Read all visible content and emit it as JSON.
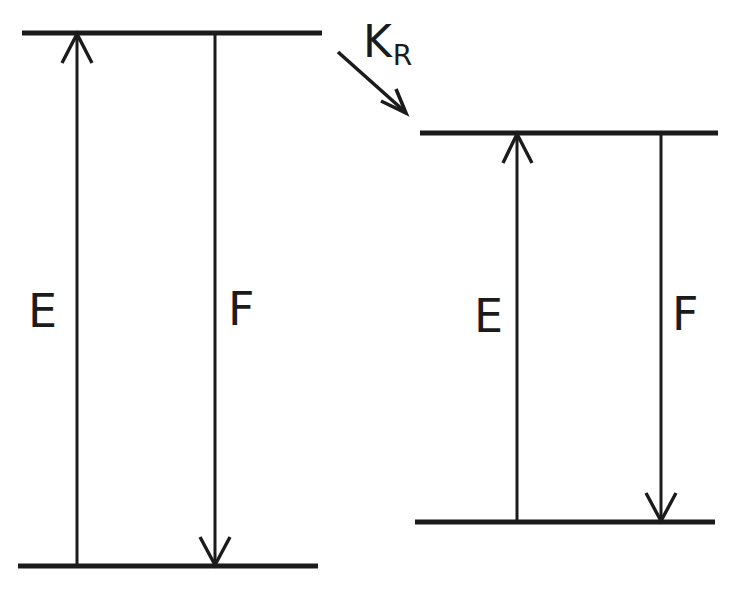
{
  "figure": {
    "kind": "energy-level-diagram",
    "background_color": "#ffffff",
    "ink_color": "#1b1b1b",
    "width": 737,
    "height": 596
  },
  "rate_process": {
    "symbol": "K",
    "subscript": "R",
    "full_label": "K_R",
    "arrow_from": [
      338,
      52
    ],
    "arrow_to": [
      405,
      112
    ],
    "direction": "down-right",
    "meaning_icon": "diagonal-arrow-icon"
  },
  "systems": [
    {
      "id": "left-system",
      "name": "left-energy-system",
      "upper_level": {
        "y": 33,
        "x_start": 22,
        "x_end": 322
      },
      "lower_level": {
        "y": 566,
        "x_start": 18,
        "x_end": 318
      },
      "transitions": [
        {
          "id": "left-absorption",
          "label": "E",
          "name": "excitation-transition",
          "direction": "up",
          "x": 77,
          "y_start": 566,
          "y_end": 33,
          "label_x": 28,
          "label_y": 288
        },
        {
          "id": "left-emission",
          "label": "F",
          "name": "fluorescence-transition",
          "direction": "down",
          "x": 215,
          "y_start": 33,
          "y_end": 566,
          "label_x": 228,
          "label_y": 286
        }
      ]
    },
    {
      "id": "right-system",
      "name": "right-energy-system",
      "upper_level": {
        "y": 133,
        "x_start": 420,
        "x_end": 718
      },
      "lower_level": {
        "y": 522,
        "x_start": 415,
        "x_end": 715
      },
      "transitions": [
        {
          "id": "right-absorption",
          "label": "E",
          "name": "excitation-transition",
          "direction": "up",
          "x": 517,
          "y_start": 522,
          "y_end": 133,
          "label_x": 474,
          "label_y": 293
        },
        {
          "id": "right-emission",
          "label": "F",
          "name": "fluorescence-transition",
          "direction": "down",
          "x": 661,
          "y_start": 133,
          "y_end": 522,
          "label_x": 672,
          "label_y": 291
        }
      ]
    }
  ],
  "labels": {
    "left_excitation": "E",
    "left_emission": "F",
    "right_excitation": "E",
    "right_emission": "F",
    "rate_symbol": "K",
    "rate_subscript": "R"
  }
}
